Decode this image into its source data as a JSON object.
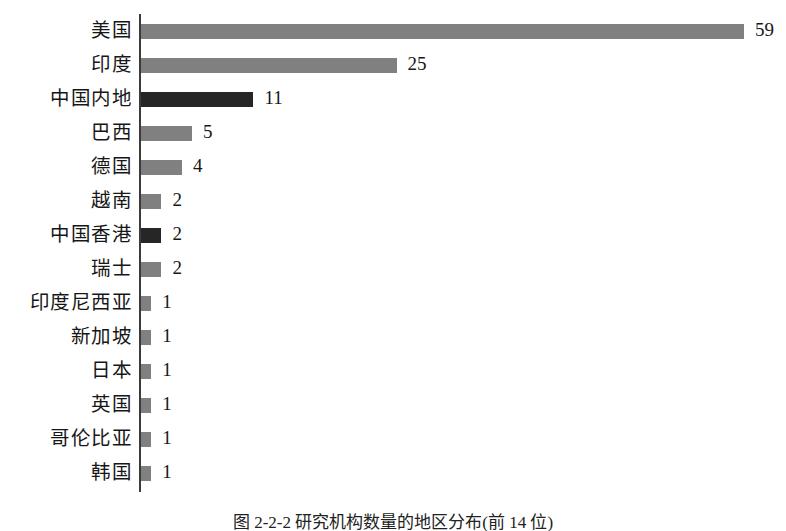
{
  "figure": {
    "caption": "图 2-2-2 研究机构数量的地区分布(前 14 位)"
  },
  "axis": {
    "name": "category-axis"
  },
  "chart_data": {
    "type": "bar",
    "orientation": "horizontal",
    "title": "",
    "subtitle": "",
    "xlabel": "",
    "ylabel": "",
    "grid": false,
    "legend": null,
    "xlim": [
      0,
      63
    ],
    "categories": [
      "美国",
      "印度",
      "中国内地",
      "巴西",
      "德国",
      "越南",
      "中国香港",
      "瑞士",
      "印度尼西亚",
      "新加坡",
      "日本",
      "英国",
      "哥伦比亚",
      "韩国"
    ],
    "values": [
      59,
      25,
      11,
      5,
      4,
      2,
      2,
      2,
      1,
      1,
      1,
      1,
      1,
      1
    ],
    "value_labels": [
      "59",
      "25",
      "11",
      "5",
      "4",
      "2",
      "2",
      "2",
      "1",
      "1",
      "1",
      "1",
      "1",
      "1"
    ],
    "bar_colors": [
      "#808080",
      "#808080",
      "#262626",
      "#808080",
      "#808080",
      "#808080",
      "#262626",
      "#808080",
      "#808080",
      "#808080",
      "#808080",
      "#808080",
      "#808080",
      "#808080"
    ],
    "colors": {
      "default_bar": "#808080",
      "highlight_bar": "#262626",
      "axis": "#3b3b3b",
      "text": "#171717",
      "background": "#ffffff"
    }
  }
}
